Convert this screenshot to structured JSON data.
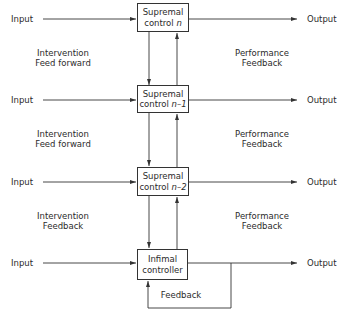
{
  "diagram": {
    "rows": [
      {
        "input_label": "Input",
        "output_label": "Output",
        "block_line1": "Supremal",
        "block_line2_prefix": "control ",
        "block_line2_var": "n"
      },
      {
        "input_label": "Input",
        "output_label": "Output",
        "block_line1": "Supremal",
        "block_line2_prefix": "control ",
        "block_line2_var": "n–1"
      },
      {
        "input_label": "Input",
        "output_label": "Output",
        "block_line1": "Supremal",
        "block_line2_prefix": "control ",
        "block_line2_var": "n–2"
      },
      {
        "input_label": "Input",
        "output_label": "Output",
        "block_line1": "Infimal",
        "block_line2_prefix": "controller",
        "block_line2_var": ""
      }
    ],
    "left_links": [
      {
        "line1": "Intervention",
        "line2": "Feed forward"
      },
      {
        "line1": "Intervention",
        "line2": "Feed forward"
      },
      {
        "line1": "Intervention",
        "line2": "Feedback"
      }
    ],
    "right_links": [
      {
        "line1": "Performance",
        "line2": "Feedback"
      },
      {
        "line1": "Performance",
        "line2": "Feedback"
      },
      {
        "line1": "Performance",
        "line2": "Feedback"
      }
    ],
    "loop_label": "Feedback",
    "colors": {
      "line": "#333333",
      "text": "#2b2b2b",
      "background": "#ffffff"
    }
  }
}
